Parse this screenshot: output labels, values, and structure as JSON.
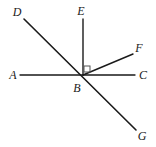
{
  "figure": {
    "type": "geometry-diagram",
    "background_color": "#ffffff",
    "stroke_color": "#1a1a1a",
    "label_color": "#1a1a1a",
    "width": 156,
    "height": 147
  },
  "points": [
    {
      "id": "A",
      "label": "A",
      "x": 13,
      "y": 75,
      "role": "ray-endpoint-left"
    },
    {
      "id": "B",
      "label": "B",
      "x": 77,
      "y": 88,
      "role": "vertex"
    },
    {
      "id": "C",
      "label": "C",
      "x": 143,
      "y": 75,
      "role": "ray-endpoint-right"
    },
    {
      "id": "D",
      "label": "D",
      "x": 17,
      "y": 12,
      "role": "ray-endpoint-upper-left"
    },
    {
      "id": "E",
      "label": "E",
      "x": 81,
      "y": 11,
      "role": "ray-endpoint-top"
    },
    {
      "id": "F",
      "label": "F",
      "x": 139,
      "y": 48,
      "role": "ray-endpoint-upper-right"
    },
    {
      "id": "G",
      "label": "G",
      "x": 142,
      "y": 136,
      "role": "ray-endpoint-lower-right"
    }
  ],
  "vertex": {
    "id": "B",
    "x": 83,
    "y": 75
  },
  "segments": [
    {
      "id": "AC",
      "name": "line-a-c",
      "from": "A",
      "to": "C",
      "x1": 20,
      "y1": 75,
      "x2": 135,
      "y2": 75
    },
    {
      "id": "DG",
      "name": "line-d-g",
      "from": "D",
      "to": "G",
      "x1": 24,
      "y1": 19,
      "x2": 136,
      "y2": 130
    },
    {
      "id": "BE",
      "name": "ray-b-e",
      "from": "B",
      "to": "E",
      "x1": 83,
      "y1": 75,
      "x2": 83,
      "y2": 19
    },
    {
      "id": "BF",
      "name": "ray-b-f",
      "from": "B",
      "to": "F",
      "x1": 83,
      "y1": 75,
      "x2": 133,
      "y2": 54
    }
  ],
  "angle_markers": [
    {
      "id": "right-angle-EBF",
      "type": "right-angle-square",
      "at": "B",
      "between": [
        "BE",
        "BF"
      ],
      "x": 84,
      "y": 66,
      "size": 6
    }
  ]
}
